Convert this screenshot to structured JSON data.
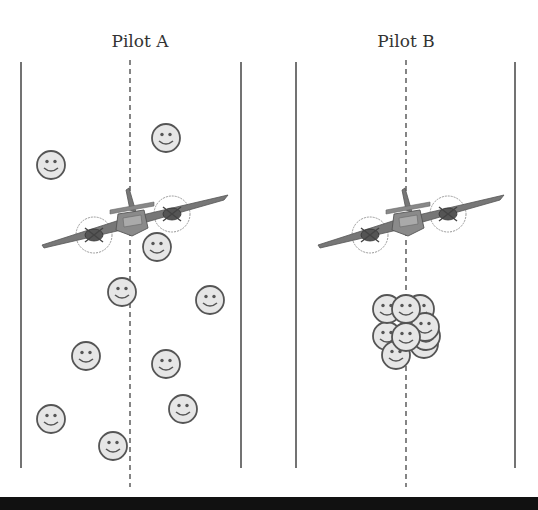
{
  "figure": {
    "top_cut_text": "",
    "panels": [
      {
        "id": "pilot-a",
        "label": "Pilot A",
        "left_line_x": 21,
        "center_line_x": 130,
        "right_line_x": 241,
        "plane": {
          "cx": 130,
          "cy": 222
        },
        "description": "people scattered across the field",
        "people": [
          {
            "x": 51,
            "y": 165
          },
          {
            "x": 166,
            "y": 138
          },
          {
            "x": 157,
            "y": 247
          },
          {
            "x": 122,
            "y": 292
          },
          {
            "x": 210,
            "y": 300
          },
          {
            "x": 86,
            "y": 356
          },
          {
            "x": 166,
            "y": 364
          },
          {
            "x": 183,
            "y": 409
          },
          {
            "x": 51,
            "y": 419
          },
          {
            "x": 113,
            "y": 446
          }
        ]
      },
      {
        "id": "pilot-b",
        "label": "Pilot B",
        "left_line_x": 296,
        "center_line_x": 406,
        "right_line_x": 515,
        "plane": {
          "cx": 406,
          "cy": 222
        },
        "description": "people clustered near the center line",
        "people": [
          {
            "x": 420,
            "y": 318
          },
          {
            "x": 387,
            "y": 309
          },
          {
            "x": 406,
            "y": 308
          },
          {
            "x": 426,
            "y": 344
          },
          {
            "x": 424,
            "y": 335
          },
          {
            "x": 424,
            "y": 326
          },
          {
            "x": 387,
            "y": 336
          },
          {
            "x": 406,
            "y": 337
          },
          {
            "x": 396,
            "y": 355
          }
        ]
      }
    ],
    "colors": {
      "line": "#444444",
      "face_fill": "#e6e6e6",
      "face_stroke": "#555555",
      "plane": "#6a6a6a",
      "bar": "#111111"
    }
  }
}
